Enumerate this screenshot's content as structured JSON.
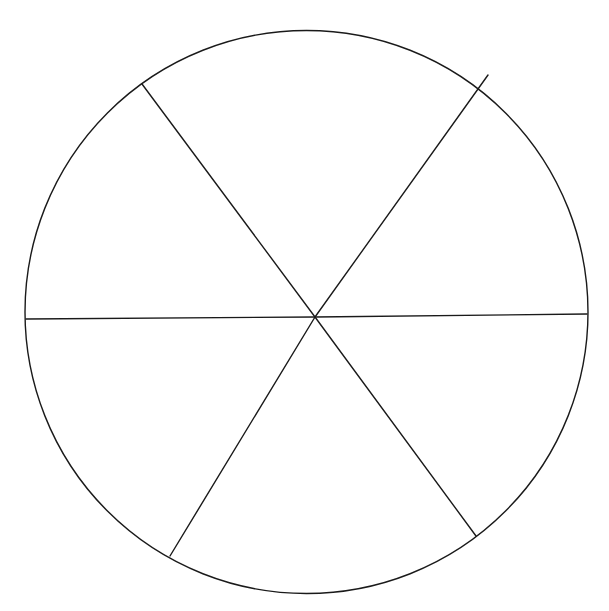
{
  "diagram": {
    "type": "segmented-circle",
    "segments": 6,
    "labels": [],
    "colors": {
      "background": "#ffffff",
      "stroke": "#1a1a1a"
    },
    "circle": {
      "cx": 306.5,
      "cy": 312,
      "r": 281.5,
      "stroke_width": 1.4
    },
    "hub": {
      "x": 315,
      "y": 317
    },
    "spokes": [
      {
        "name": "spoke-left",
        "x1": 26,
        "y1": 319,
        "x2": 315,
        "y2": 317
      },
      {
        "name": "spoke-right",
        "x1": 315,
        "y1": 317,
        "x2": 587,
        "y2": 314
      },
      {
        "name": "spoke-top-left",
        "x1": 142,
        "y1": 84,
        "x2": 315,
        "y2": 317
      },
      {
        "name": "spoke-top-right",
        "x1": 488,
        "y1": 75,
        "x2": 315,
        "y2": 317
      },
      {
        "name": "spoke-bottom-left",
        "x1": 170,
        "y1": 556,
        "x2": 315,
        "y2": 317
      },
      {
        "name": "spoke-bottom-right",
        "x1": 476,
        "y1": 536,
        "x2": 315,
        "y2": 317
      }
    ]
  }
}
